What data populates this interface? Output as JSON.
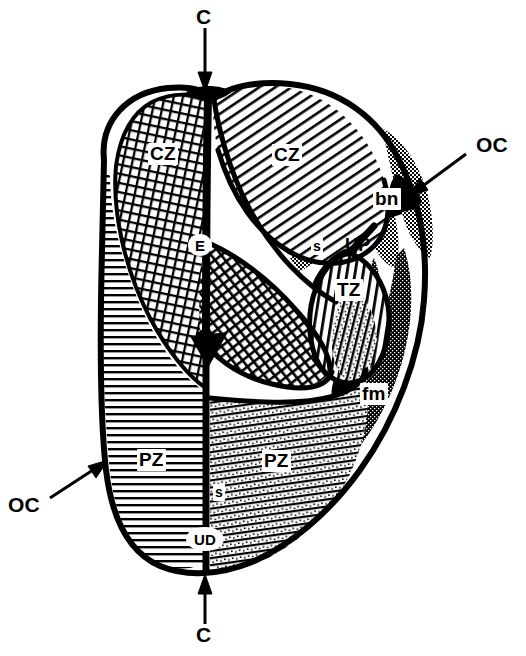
{
  "figure": {
    "background_color": "#ffffff",
    "ink_color": "#000000",
    "stipple_color": "#555555"
  },
  "labels": {
    "cz_left": {
      "text": "CZ",
      "x": 148,
      "y": 143,
      "size": 19,
      "style": "boxed",
      "meaning": "central-zone-left"
    },
    "cz_right": {
      "text": "CZ",
      "x": 272,
      "y": 144,
      "size": 19,
      "style": "boxed",
      "meaning": "central-zone-right"
    },
    "e_duct": {
      "text": "E",
      "x": 188,
      "y": 234,
      "size": 15,
      "style": "badge",
      "meaning": "ejaculatory-duct"
    },
    "bn": {
      "text": "bn",
      "x": 373,
      "y": 188,
      "size": 19,
      "style": "boxed",
      "meaning": "bladder-neck"
    },
    "s_upper": {
      "text": "s",
      "x": 311,
      "y": 238,
      "size": 14,
      "style": "boxed",
      "meaning": "sphincter-preprostatic"
    },
    "up": {
      "text": "UP",
      "x": 345,
      "y": 236,
      "size": 18,
      "style": "plain",
      "meaning": "urethra-proximal"
    },
    "tz": {
      "text": "TZ",
      "x": 335,
      "y": 279,
      "size": 19,
      "style": "boxed",
      "meaning": "transition-zone"
    },
    "fm": {
      "text": "fm",
      "x": 360,
      "y": 383,
      "size": 19,
      "style": "boxed",
      "meaning": "anterior-fibromuscular-stroma"
    },
    "pz_left": {
      "text": "PZ",
      "x": 137,
      "y": 449,
      "size": 19,
      "style": "boxed",
      "meaning": "peripheral-zone-left"
    },
    "pz_right": {
      "text": "PZ",
      "x": 262,
      "y": 450,
      "size": 19,
      "style": "boxed",
      "meaning": "peripheral-zone-right"
    },
    "s_lower": {
      "text": "s",
      "x": 213,
      "y": 484,
      "size": 14,
      "style": "boxed",
      "meaning": "sphincter-distal-striated"
    },
    "ud": {
      "text": "UD",
      "x": 186,
      "y": 527,
      "size": 15,
      "style": "badge",
      "meaning": "urethra-distal"
    },
    "c_top": {
      "text": "C",
      "x": 190,
      "y": 8,
      "size": 21,
      "style": "plain",
      "meaning": "coronal-plane-top"
    },
    "c_bottom": {
      "text": "C",
      "x": 190,
      "y": 628,
      "size": 21,
      "style": "plain",
      "meaning": "coronal-plane-bottom"
    },
    "oc_right": {
      "text": "OC",
      "x": 476,
      "y": 136,
      "size": 21,
      "style": "plain",
      "meaning": "oblique-coronal-plane-right"
    },
    "oc_left": {
      "text": "OC",
      "x": 8,
      "y": 500,
      "size": 21,
      "style": "plain",
      "meaning": "oblique-coronal-plane-left"
    }
  },
  "legend_keys": [
    {
      "abbr": "CZ",
      "name": "Central zone"
    },
    {
      "abbr": "PZ",
      "name": "Peripheral zone"
    },
    {
      "abbr": "TZ",
      "name": "Transition zone"
    },
    {
      "abbr": "E",
      "name": "Ejaculatory duct"
    },
    {
      "abbr": "UP",
      "name": "Proximal urethra"
    },
    {
      "abbr": "UD",
      "name": "Distal urethra"
    },
    {
      "abbr": "bn",
      "name": "Bladder neck"
    },
    {
      "abbr": "fm",
      "name": "Anterior fibromuscular stroma"
    },
    {
      "abbr": "s",
      "name": "Sphincter"
    },
    {
      "abbr": "C",
      "name": "Coronal section plane"
    },
    {
      "abbr": "OC",
      "name": "Oblique coronal section plane"
    }
  ],
  "arrows": {
    "c_top": {
      "from_x": 205,
      "from_y": 28,
      "to_x": 205,
      "to_y": 88,
      "direction": "down"
    },
    "c_bottom": {
      "from_x": 205,
      "from_y": 625,
      "to_x": 205,
      "to_y": 578,
      "direction": "up"
    },
    "oc_right": {
      "from_x": 468,
      "from_y": 152,
      "to_x": 410,
      "to_y": 196,
      "direction": "down-left"
    },
    "oc_left": {
      "from_x": 48,
      "from_y": 500,
      "to_x": 104,
      "to_y": 462,
      "direction": "up-right"
    }
  }
}
